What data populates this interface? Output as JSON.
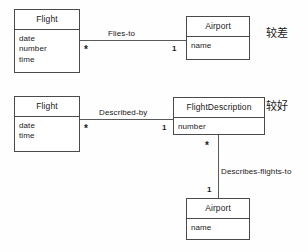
{
  "diagram": {
    "type": "uml-class-diagram",
    "background_color": "#fefefe",
    "line_color": "#5a5a5a",
    "border_color": "#4a4a4a"
  },
  "variants": [
    {
      "id": "variant-top",
      "annotation": "较差",
      "classes": [
        {
          "id": "flight-top",
          "name": "Flight",
          "attributes": [
            "date",
            "number",
            "time"
          ]
        },
        {
          "id": "airport-top",
          "name": "Airport",
          "attributes": [
            "name"
          ]
        }
      ],
      "associations": [
        {
          "id": "flies-to",
          "label": "Flies-to",
          "source_multiplicity": "*",
          "target_multiplicity": "1"
        }
      ]
    },
    {
      "id": "variant-bottom",
      "annotation": "较好",
      "classes": [
        {
          "id": "flight-bottom",
          "name": "Flight",
          "attributes": [
            "date",
            "time"
          ]
        },
        {
          "id": "flightdescription",
          "name": "FlightDescription",
          "attributes": [
            "number"
          ]
        },
        {
          "id": "airport-bottom",
          "name": "Airport",
          "attributes": [
            "name"
          ]
        }
      ],
      "associations": [
        {
          "id": "described-by",
          "label": "Described-by",
          "source_multiplicity": "*",
          "target_multiplicity": "1"
        },
        {
          "id": "describes-flights-to",
          "label": "Describes-flights-to",
          "source_multiplicity": "*",
          "target_multiplicity": "1"
        }
      ]
    }
  ]
}
